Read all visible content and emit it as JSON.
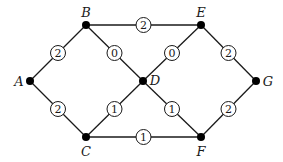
{
  "diagram": {
    "type": "weighted-graph",
    "nodes": [
      {
        "id": "A",
        "label": "A",
        "x": 30,
        "y": 81,
        "lx": 19,
        "ly": 81
      },
      {
        "id": "B",
        "label": "B",
        "x": 86,
        "y": 25,
        "lx": 86,
        "ly": 12
      },
      {
        "id": "C",
        "label": "C",
        "x": 86,
        "y": 137,
        "lx": 86,
        "ly": 151
      },
      {
        "id": "D",
        "label": "D",
        "x": 143,
        "y": 81,
        "lx": 155,
        "ly": 80
      },
      {
        "id": "E",
        "label": "E",
        "x": 201,
        "y": 25,
        "lx": 201,
        "ly": 12
      },
      {
        "id": "F",
        "label": "F",
        "x": 201,
        "y": 137,
        "lx": 201,
        "ly": 151
      },
      {
        "id": "G",
        "label": "G",
        "x": 256,
        "y": 81,
        "lx": 268,
        "ly": 81
      }
    ],
    "edges": [
      {
        "from": "A",
        "to": "B",
        "weight": "2"
      },
      {
        "from": "A",
        "to": "C",
        "weight": "2"
      },
      {
        "from": "B",
        "to": "E",
        "weight": "2"
      },
      {
        "from": "B",
        "to": "D",
        "weight": "0"
      },
      {
        "from": "E",
        "to": "D",
        "weight": "0"
      },
      {
        "from": "C",
        "to": "D",
        "weight": "1"
      },
      {
        "from": "D",
        "to": "F",
        "weight": "1"
      },
      {
        "from": "C",
        "to": "F",
        "weight": "1"
      },
      {
        "from": "E",
        "to": "G",
        "weight": "2"
      },
      {
        "from": "F",
        "to": "G",
        "weight": "2"
      }
    ]
  }
}
